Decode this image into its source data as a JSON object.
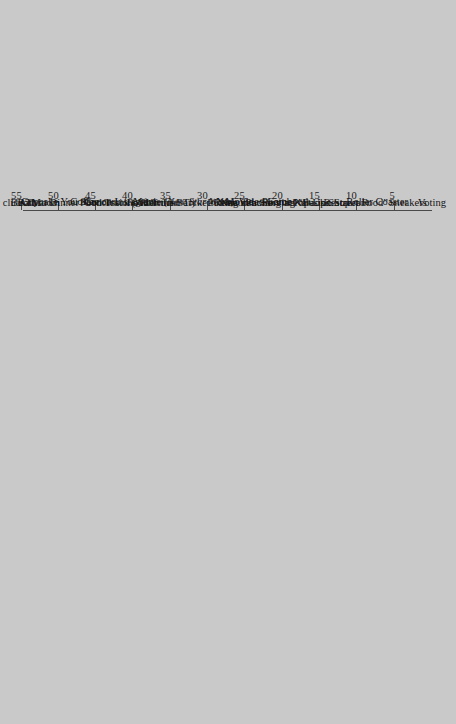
{
  "chart_data": {
    "type": "bar",
    "orientation": "horizontal",
    "title": "",
    "subtitle": "",
    "xlabel": "",
    "ylabel": "",
    "grid": false,
    "legend": false,
    "axis_max_label": "Unlimited",
    "tick_labels": [
      "5",
      "10",
      "15",
      "20",
      "25",
      "30",
      "35",
      "40",
      "45",
      "50",
      "55",
      "60",
      "Unlimited"
    ],
    "tick_values": [
      5,
      10,
      15,
      20,
      25,
      30,
      35,
      40,
      45,
      50,
      55,
      60,
      65
    ],
    "xlim": [
      0,
      67
    ],
    "bar_color": "#ffffff",
    "background_color": "#c9c9c9",
    "axis_color": "#4a4a4a",
    "categories": [
      "Voting",
      "Sneakers",
      "Roller Coaster",
      "Restaurant Serving “Fusion Street Food”",
      "Restaurant",
      "Pop-Up Shop",
      "Putting in a Song at Karaoke",
      "Photobooth",
      "New Video Game",
      "New iPhone",
      "Movie",
      "Movie (New Star Wars)",
      "Hamilton Tickets",
      "Food Truck (After the Bar)",
      "Food Truck",
      "Cupcake You Saw on Instagram",
      "Concessions",
      "Concert",
      "Coffee",
      "Booth at Dinner",
      "Bathroom",
      "ATM",
      "Any club"
    ],
    "categories_italic_part": {
      "Movie (New Star Wars)": "New Star Wars",
      "Hamilton Tickets": "Hamilton"
    },
    "values": [
      65,
      10,
      52,
      5,
      34,
      10,
      15,
      12,
      10,
      4,
      65,
      15,
      15,
      48,
      15,
      5,
      15,
      44,
      8,
      6,
      15,
      10,
      20
    ],
    "value_labels": [
      "Unlimited",
      "10",
      "52",
      "5",
      "34",
      "10",
      "15",
      "12",
      "10",
      "4",
      "Unlimited",
      "15",
      "15",
      "48",
      "15",
      "5",
      "15",
      "44",
      "8",
      "6",
      "15",
      "10",
      "20"
    ]
  }
}
